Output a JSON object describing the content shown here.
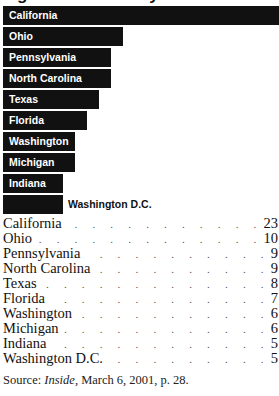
{
  "title": "Figure: Charters by State",
  "chart_data": {
    "type": "bar",
    "orientation": "horizontal",
    "title": "Charters by State",
    "categories": [
      "California",
      "Ohio",
      "Pennsylvania",
      "North Carolina",
      "Texas",
      "Florida",
      "Washington",
      "Michigan",
      "Indiana",
      "Washington D.C."
    ],
    "values": [
      23,
      10,
      9,
      9,
      8,
      7,
      6,
      6,
      5,
      5
    ],
    "xlabel": "",
    "ylabel": "",
    "grid": false,
    "legend": null
  },
  "bars": [
    {
      "label": "California",
      "value": 23,
      "width": 276
    },
    {
      "label": "Ohio",
      "value": 10,
      "width": 120
    },
    {
      "label": "Pennsylvania",
      "value": 9,
      "width": 108
    },
    {
      "label": "North Carolina",
      "value": 9,
      "width": 108
    },
    {
      "label": "Texas",
      "value": 8,
      "width": 96
    },
    {
      "label": "Florida",
      "value": 7,
      "width": 84
    },
    {
      "label": "Washington",
      "value": 6,
      "width": 72
    },
    {
      "label": "Michigan",
      "value": 6,
      "width": 72
    },
    {
      "label": "Indiana",
      "value": 5,
      "width": 60
    },
    {
      "label": "Washington D.C.",
      "value": 5,
      "width": 60
    }
  ],
  "list": [
    {
      "name": "California",
      "value": "23"
    },
    {
      "name": "Ohio",
      "value": "10"
    },
    {
      "name": "Pennsylvania",
      "value": "9"
    },
    {
      "name": "North Carolina",
      "value": "9"
    },
    {
      "name": "Texas",
      "value": "8"
    },
    {
      "name": "Florida",
      "value": "7"
    },
    {
      "name": "Washington",
      "value": "6"
    },
    {
      "name": "Michigan",
      "value": "6"
    },
    {
      "name": "Indiana",
      "value": "5"
    },
    {
      "name": "Washington D.C.",
      "value": "5"
    }
  ],
  "source": {
    "prefix": "Source: ",
    "publication": "Inside",
    "suffix": ", March 6, 2001, p. 28."
  },
  "leader_dots": ". . . . . . . . . . . . . . . . . . . . . . . . . . . ."
}
